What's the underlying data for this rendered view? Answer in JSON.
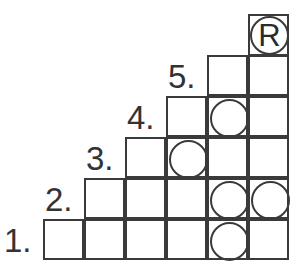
{
  "puzzle": {
    "rows": [
      {
        "label": "1.",
        "start_col": 0,
        "circles": [
          4
        ]
      },
      {
        "label": "2.",
        "start_col": 1,
        "circles": [
          4,
          5
        ]
      },
      {
        "label": "3.",
        "start_col": 2,
        "circles": [
          3
        ]
      },
      {
        "label": "4.",
        "start_col": 3,
        "circles": [
          4
        ]
      },
      {
        "label": "5.",
        "start_col": 4,
        "circles": []
      }
    ],
    "top_cell": {
      "col": 5,
      "symbol": "R"
    },
    "columns": 6
  },
  "colors": {
    "line": "#3a3a3a",
    "background": "#ffffff",
    "text": "#333333"
  }
}
